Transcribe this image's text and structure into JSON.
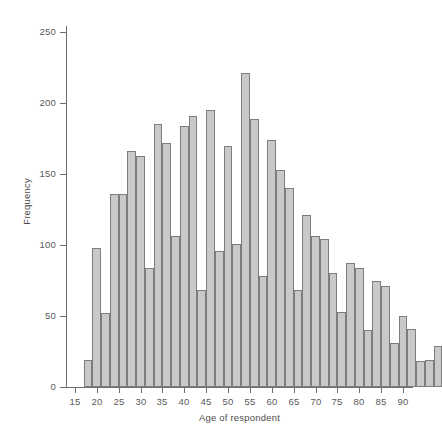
{
  "chart_data": {
    "type": "bar",
    "title": "",
    "subtitle": "",
    "xlabel": "Age of respondent",
    "ylabel": "Frequency",
    "grid": false,
    "legend": null,
    "xlim": [
      15,
      90
    ],
    "ylim": [
      0,
      265
    ],
    "bin_width": 2,
    "x_ticks": [
      15,
      20,
      25,
      30,
      35,
      40,
      45,
      50,
      55,
      60,
      65,
      70,
      75,
      80,
      85,
      90
    ],
    "x_tick_labels": [
      "15",
      "20",
      "25",
      "30",
      "35",
      "40",
      "45",
      "50",
      "55",
      "60",
      "65",
      "70",
      "75",
      "80",
      "85",
      "90"
    ],
    "y_ticks": [
      0,
      50,
      100,
      150,
      200,
      250
    ],
    "y_tick_labels": [
      "0",
      "50",
      "100",
      "150",
      "200",
      "250"
    ],
    "bar_fill": "#c9c9c9",
    "bar_stroke": "#7d7d7d",
    "axis_color": "#6e6e6e",
    "bins": [
      {
        "x0": 17,
        "x1": 19,
        "center": 18,
        "value": 19
      },
      {
        "x0": 19,
        "x1": 21,
        "center": 20,
        "value": 98
      },
      {
        "x0": 21,
        "x1": 23,
        "center": 22,
        "value": 52
      },
      {
        "x0": 23,
        "x1": 25,
        "center": 24,
        "value": 136
      },
      {
        "x0": 25,
        "x1": 27,
        "center": 26,
        "value": 136
      },
      {
        "x0": 27,
        "x1": 29,
        "center": 28,
        "value": 166
      },
      {
        "x0": 29,
        "x1": 31,
        "center": 30,
        "value": 163
      },
      {
        "x0": 31,
        "x1": 33,
        "center": 32,
        "value": 84
      },
      {
        "x0": 33,
        "x1": 35,
        "center": 34,
        "value": 185
      },
      {
        "x0": 35,
        "x1": 37,
        "center": 36,
        "value": 172
      },
      {
        "x0": 37,
        "x1": 39,
        "center": 38,
        "value": 106
      },
      {
        "x0": 39,
        "x1": 41,
        "center": 40,
        "value": 184
      },
      {
        "x0": 41,
        "x1": 43,
        "center": 42,
        "value": 191
      },
      {
        "x0": 43,
        "x1": 45,
        "center": 44,
        "value": 68
      },
      {
        "x0": 45,
        "x1": 47,
        "center": 46,
        "value": 195
      },
      {
        "x0": 47,
        "x1": 49,
        "center": 48,
        "value": 96
      },
      {
        "x0": 49,
        "x1": 51,
        "center": 50,
        "value": 170
      },
      {
        "x0": 51,
        "x1": 53,
        "center": 52,
        "value": 101
      },
      {
        "x0": 53,
        "x1": 55,
        "center": 54,
        "value": 221
      },
      {
        "x0": 55,
        "x1": 57,
        "center": 56,
        "value": 189
      },
      {
        "x0": 57,
        "x1": 59,
        "center": 58,
        "value": 78
      },
      {
        "x0": 59,
        "x1": 61,
        "center": 60,
        "value": 174
      },
      {
        "x0": 61,
        "x1": 63,
        "center": 62,
        "value": 153
      },
      {
        "x0": 63,
        "x1": 65,
        "center": 64,
        "value": 140
      },
      {
        "x0": 65,
        "x1": 67,
        "center": 66,
        "value": 68
      },
      {
        "x0": 67,
        "x1": 69,
        "center": 68,
        "value": 121
      },
      {
        "x0": 69,
        "x1": 71,
        "center": 70,
        "value": 106
      },
      {
        "x0": 71,
        "x1": 73,
        "center": 72,
        "value": 104
      },
      {
        "x0": 73,
        "x1": 75,
        "center": 74,
        "value": 80
      },
      {
        "x0": 75,
        "x1": 77,
        "center": 76,
        "value": 53
      },
      {
        "x0": 77,
        "x1": 79,
        "center": 78,
        "value": 87
      },
      {
        "x0": 79,
        "x1": 81,
        "center": 80,
        "value": 84
      },
      {
        "x0": 81,
        "x1": 83,
        "center": 82,
        "value": 40
      },
      {
        "x0": 83,
        "x1": 85,
        "center": 84,
        "value": 75
      },
      {
        "x0": 85,
        "x1": 87,
        "center": 86,
        "value": 71
      },
      {
        "x0": 87,
        "x1": 89,
        "center": 88,
        "value": 31
      },
      {
        "x0": 89,
        "x1": 91,
        "center": 90,
        "value": 50
      },
      {
        "x0": 91,
        "x1": 93,
        "center": 92,
        "value": 41
      },
      {
        "x0": 93,
        "x1": 95,
        "center": 94,
        "value": 18
      },
      {
        "x0": 95,
        "x1": 97,
        "center": 96,
        "value": 19
      },
      {
        "x0": 97,
        "x1": 99,
        "center": 98,
        "value": 29
      }
    ]
  }
}
